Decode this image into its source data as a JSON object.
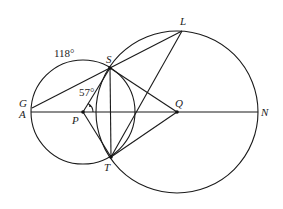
{
  "diagram": {
    "type": "circle-geometry",
    "angle_labels": {
      "arc_GS": "118°",
      "angle_SPA": "57°"
    },
    "points": {
      "G": {
        "label": "G",
        "x": 31,
        "y": 108
      },
      "A": {
        "label": "A",
        "x": 31,
        "y": 112
      },
      "P": {
        "label": "P",
        "x": 83,
        "y": 112
      },
      "Q": {
        "label": "Q",
        "x": 177,
        "y": 112
      },
      "N": {
        "label": "N",
        "x": 258,
        "y": 112
      },
      "S": {
        "label": "S",
        "x": 110,
        "y": 68
      },
      "T": {
        "label": "T",
        "x": 111,
        "y": 157
      },
      "L": {
        "label": "L",
        "x": 182,
        "y": 30
      }
    },
    "circles": [
      {
        "name": "circle-P",
        "center": "P",
        "radius": 52
      },
      {
        "name": "circle-Q",
        "center": "Q",
        "radius": 81
      }
    ],
    "segments": [
      [
        "A",
        "N"
      ],
      [
        "G",
        "L"
      ],
      [
        "T",
        "L"
      ],
      [
        "P",
        "S"
      ],
      [
        "P",
        "T"
      ],
      [
        "S",
        "Q"
      ],
      [
        "T",
        "Q"
      ],
      [
        "S",
        "T"
      ]
    ],
    "colors": {
      "ink": "#1a1a1a",
      "background": "#ffffff"
    }
  }
}
